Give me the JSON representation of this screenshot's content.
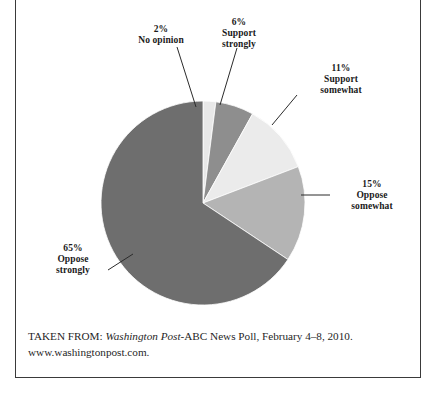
{
  "figure": {
    "background_color": "#ffffff",
    "frame_color": "#3a3a3a"
  },
  "caption": {
    "prefix": "TAKEN FROM: ",
    "source_italic": "Washington Post",
    "source_rest": "-ABC News Poll, February 4–8, 2010.",
    "url": "www.washingtonpost.com."
  },
  "labels": {
    "no_opinion": "2%\nNo opinion",
    "support_strongly": "6%\nSupport\nstrongly",
    "support_somewhat": "11%\nSupport\nsomewhat",
    "oppose_somewhat": "15%\nOppose\nsomewhat",
    "oppose_strongly": "65%\nOppose\nstrongly"
  },
  "chart_data": {
    "type": "pie",
    "title": "",
    "subtitle": "",
    "xlabel": "",
    "ylabel": "",
    "legend_position": "callout-labels",
    "grid": false,
    "start_angle_deg": 0,
    "direction": "clockwise",
    "center_px": [
      203,
      203
    ],
    "radius_px": 102,
    "total": 99,
    "units": "percent",
    "categories": [
      "No opinion",
      "Support strongly",
      "Support somewhat",
      "Oppose somewhat",
      "Oppose strongly"
    ],
    "values": [
      2,
      6,
      11,
      15,
      65
    ],
    "colors": [
      "#e8e8e8",
      "#8e8e8e",
      "#ebebeb",
      "#b4b4b4",
      "#6e6e6e"
    ],
    "slices": [
      {
        "label": "No opinion",
        "value": 2,
        "display": "2%",
        "color": "#e8e8e8"
      },
      {
        "label": "Support strongly",
        "value": 6,
        "display": "6%",
        "color": "#8e8e8e"
      },
      {
        "label": "Support somewhat",
        "value": 11,
        "display": "11%",
        "color": "#ebebeb"
      },
      {
        "label": "Oppose somewhat",
        "value": 15,
        "display": "15%",
        "color": "#b4b4b4"
      },
      {
        "label": "Oppose strongly",
        "value": 65,
        "display": "65%",
        "color": "#6e6e6e"
      }
    ]
  }
}
